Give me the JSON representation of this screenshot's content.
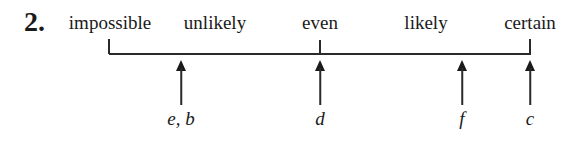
{
  "question": {
    "number": "2."
  },
  "scale": {
    "labels": [
      {
        "text": "impossible",
        "x": 110
      },
      {
        "text": "unlikely",
        "x": 215
      },
      {
        "text": "even",
        "x": 320
      },
      {
        "text": "likely",
        "x": 426
      },
      {
        "text": "certain",
        "x": 530
      }
    ],
    "line": {
      "x_start": 109,
      "x_end": 531,
      "y": 54
    },
    "ticks": [
      {
        "x": 109
      },
      {
        "x": 320
      },
      {
        "x": 530
      }
    ]
  },
  "points": [
    {
      "label": "e, b",
      "x": 181
    },
    {
      "label": "d",
      "x": 320
    },
    {
      "label": "f",
      "x": 462
    },
    {
      "label": "c",
      "x": 530
    }
  ]
}
